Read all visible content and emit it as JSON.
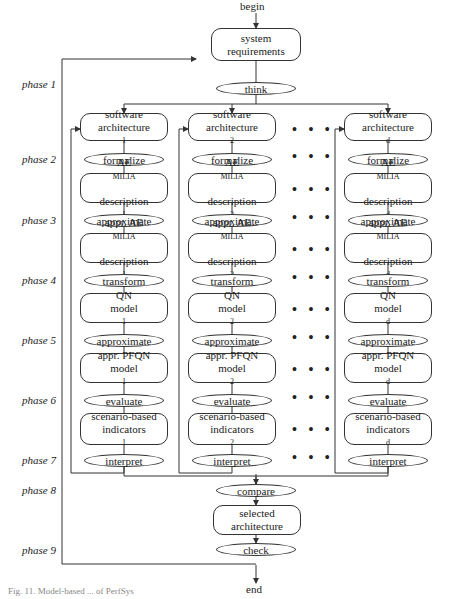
{
  "begin_label": "begin",
  "end_label": "end",
  "top": {
    "req_line1": "system",
    "req_line2": "requirements",
    "think": "think"
  },
  "phases": [
    "phase 1",
    "phase 2",
    "phase 3",
    "phase 4",
    "phase 5",
    "phase 6",
    "phase 7",
    "phase 8",
    "phase 9"
  ],
  "columns": [
    {
      "sub": "1"
    },
    {
      "sub": "2"
    },
    {
      "sub": "d"
    }
  ],
  "labels": {
    "sa1": "software",
    "sa2": "architecture",
    "formalize": "formalize",
    "ae1": "AE",
    "ae1sc": "milia",
    "ae2": "description",
    "approximate": "approximate",
    "appr_ae": "appr. AE",
    "appr_aesc": "milia",
    "transform": "transform",
    "qn1": "QN",
    "model": "model",
    "pfqn": "appr. PFQN",
    "evaluate": "evaluate",
    "sb": "scenario-based",
    "ind": "indicators",
    "interpret": "interpret"
  },
  "bottom": {
    "compare": "compare",
    "sel1": "selected",
    "sel2": "architecture",
    "check": "check"
  },
  "dots": "• • •",
  "caption": "Fig. 11. Model-based ... of PerfSys"
}
